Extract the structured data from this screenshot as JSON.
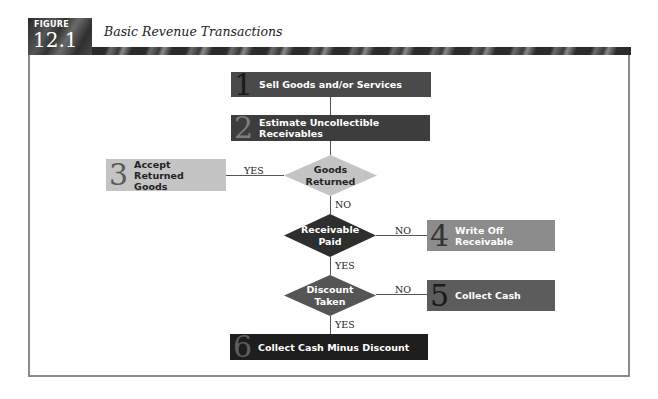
{
  "figure": {
    "badge_label": "FIGURE",
    "number": "12.1",
    "title": "Basic Revenue Transactions"
  },
  "flowchart": {
    "steps": [
      {
        "num": "1",
        "label": "Sell Goods and/or Services",
        "fill": "#4a4a4a"
      },
      {
        "num": "2",
        "label": "Estimate Uncollectible Receivables",
        "fill": "#3d3d3d"
      },
      {
        "num": "3",
        "label": "Accept Returned Goods",
        "fill": "#c4c4c4"
      },
      {
        "num": "4",
        "label": "Write Off Receivable",
        "fill": "#8c8c8c"
      },
      {
        "num": "5",
        "label": "Collect Cash",
        "fill": "#5c5c5c"
      },
      {
        "num": "6",
        "label": "Collect Cash Minus Discount",
        "fill": "#1e1e1e"
      }
    ],
    "decisions": [
      {
        "line1": "Goods",
        "line2": "Returned",
        "fill": "#c4c4c4"
      },
      {
        "line1": "Receivable",
        "line2": "Paid",
        "fill": "#2e2e2e"
      },
      {
        "line1": "Discount",
        "line2": "Taken",
        "fill": "#555555"
      }
    ],
    "edge_labels": {
      "goods_returned_yes": "YES",
      "goods_returned_no": "NO",
      "receivable_paid_no": "NO",
      "receivable_paid_yes": "YES",
      "discount_taken_no": "NO",
      "discount_taken_yes": "YES"
    }
  }
}
